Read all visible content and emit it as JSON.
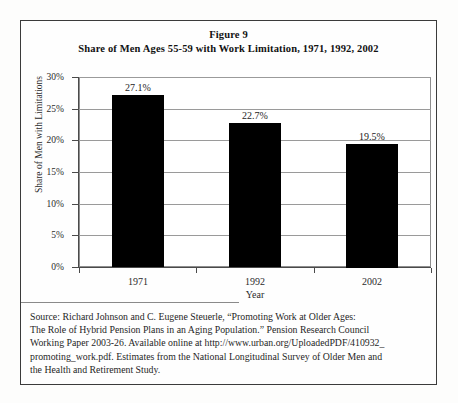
{
  "figure": {
    "title_line1": "Figure 9",
    "title_line2": "Share of Men Ages 55-59 with Work Limitation, 1971, 1992, 2002",
    "border_color": "#3b3b3b",
    "background_color": "#fefefe"
  },
  "chart_data": {
    "type": "bar",
    "title": "Share of Men Ages 55-59 with Work Limitation, 1971, 1992, 2002",
    "subtitle": "Figure 9",
    "categories": [
      "1971",
      "1992",
      "2002"
    ],
    "values": [
      27.1,
      22.7,
      19.5
    ],
    "data_labels": [
      "27.1%",
      "22.7%",
      "19.5%"
    ],
    "xlabel": "Year",
    "ylabel": "Share of Men with Limitations",
    "ylim": [
      0,
      30
    ],
    "yticks": [
      0,
      5,
      10,
      15,
      20,
      25,
      30
    ],
    "ytick_labels": [
      "0%",
      "5%",
      "10%",
      "15%",
      "20%",
      "25%",
      "30%"
    ],
    "grid": true,
    "grid_axis": "y",
    "legend": false,
    "bar_color": "#000000",
    "gridline_color": "#9a9a9a",
    "axis_color": "#4a4a4a"
  },
  "source_note": {
    "lines": [
      "Source: Richard Johnson and C. Eugene Steuerle, “Promoting Work at Older Ages:",
      "The Role of Hybrid Pension Plans in an Aging Population.” Pension Research Council",
      "Working Paper 2003-26. Available online at http://www.urban.org/UploadedPDF/410932_",
      "promoting_work.pdf. Estimates from the National Longitudinal Survey of Older Men and",
      "the Health and Retirement Study."
    ]
  }
}
